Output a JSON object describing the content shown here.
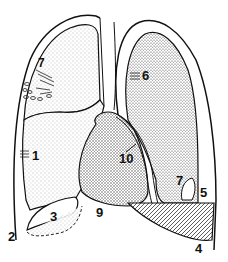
{
  "diagram": {
    "type": "anatomical-illustration",
    "colors": {
      "ink": "#111111",
      "background": "#ffffff",
      "stipple": "#555555"
    },
    "labels": [
      {
        "id": "1",
        "text": "1"
      },
      {
        "id": "2",
        "text": "2"
      },
      {
        "id": "3",
        "text": "3"
      },
      {
        "id": "4",
        "text": "4"
      },
      {
        "id": "5",
        "text": "5"
      },
      {
        "id": "6",
        "text": "6"
      },
      {
        "id": "7",
        "text": "7"
      },
      {
        "id": "8",
        "text": "8"
      },
      {
        "id": "9",
        "text": "9"
      },
      {
        "id": "10",
        "text": "10"
      }
    ]
  }
}
